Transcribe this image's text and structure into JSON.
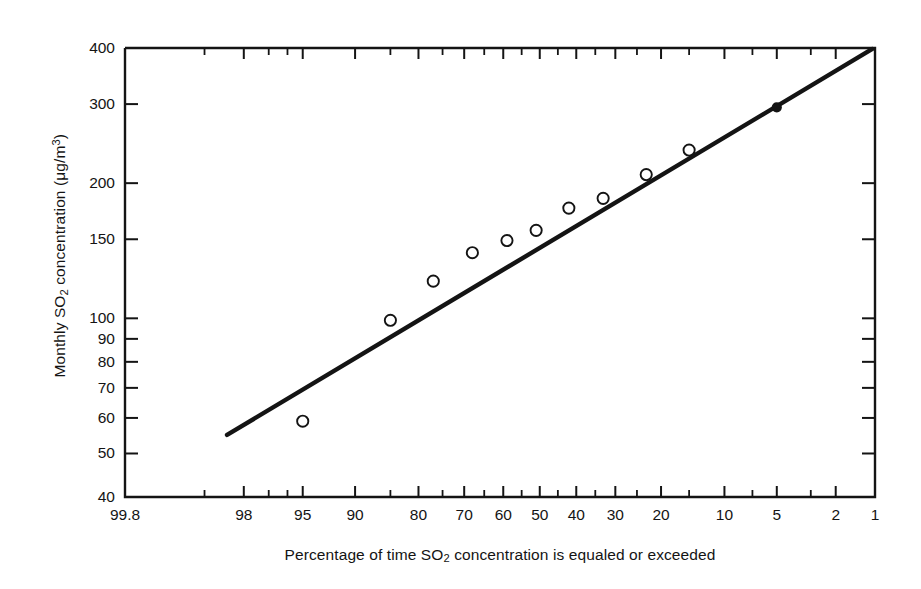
{
  "chart_data": {
    "type": "scatter",
    "title": "",
    "subtitle": "",
    "xlabel_parts": {
      "pre": "Percentage of time SO",
      "sub": "2",
      "post": " concentration is equaled or exceeded"
    },
    "ylabel_parts": {
      "pre": "Monthly SO",
      "sub": "2",
      "mid": " concentration (μg/m",
      "sup": "3",
      "post": ")"
    },
    "xlabel": "Percentage of time SO2 concentration is equaled or exceeded",
    "ylabel": "Monthly SO2 concentration (μg/m3)",
    "x_scale": "probability",
    "y_scale": "log",
    "xlim": [
      99.8,
      1
    ],
    "ylim": [
      40,
      400
    ],
    "grid": false,
    "legend": "none",
    "x_ticks": [
      {
        "value": 99.8,
        "label": "99.8"
      },
      {
        "value": 98,
        "label": "98"
      },
      {
        "value": 95,
        "label": "95"
      },
      {
        "value": 90,
        "label": "90"
      },
      {
        "value": 80,
        "label": "80"
      },
      {
        "value": 70,
        "label": "70"
      },
      {
        "value": 60,
        "label": "60"
      },
      {
        "value": 50,
        "label": "50"
      },
      {
        "value": 40,
        "label": "40"
      },
      {
        "value": 30,
        "label": "30"
      },
      {
        "value": 20,
        "label": "20"
      },
      {
        "value": 10,
        "label": "10"
      },
      {
        "value": 5,
        "label": "5"
      },
      {
        "value": 2,
        "label": "2"
      },
      {
        "value": 1,
        "label": "1"
      }
    ],
    "x_minor_ticks": [
      99,
      97,
      96,
      85,
      75,
      65,
      55,
      45,
      35,
      25,
      15,
      7,
      3
    ],
    "y_ticks": [
      {
        "value": 400,
        "label": "400"
      },
      {
        "value": 300,
        "label": "300"
      },
      {
        "value": 200,
        "label": "200"
      },
      {
        "value": 150,
        "label": "150"
      },
      {
        "value": 100,
        "label": "100"
      },
      {
        "value": 90,
        "label": "90"
      },
      {
        "value": 80,
        "label": "80"
      },
      {
        "value": 70,
        "label": "70"
      },
      {
        "value": 60,
        "label": "60"
      },
      {
        "value": 50,
        "label": "50"
      },
      {
        "value": 40,
        "label": "40"
      }
    ],
    "series": [
      {
        "name": "Observed monthly concentrations",
        "marker": "open-circle",
        "points": [
          {
            "x": 95,
            "y": 59
          },
          {
            "x": 85,
            "y": 99
          },
          {
            "x": 77,
            "y": 121
          },
          {
            "x": 68,
            "y": 140
          },
          {
            "x": 59,
            "y": 149
          },
          {
            "x": 51,
            "y": 157
          },
          {
            "x": 42,
            "y": 176
          },
          {
            "x": 33,
            "y": 185
          },
          {
            "x": 23,
            "y": 209
          },
          {
            "x": 15,
            "y": 237
          }
        ]
      },
      {
        "name": "Highlighted point",
        "marker": "filled-circle",
        "points": [
          {
            "x": 5,
            "y": 295
          }
        ]
      }
    ],
    "fit_line": {
      "name": "Log-normal fit line",
      "style": "solid",
      "color": "#141414",
      "x_start": 98.5,
      "y_start": 55,
      "x_end": 1.05,
      "y_end": 398
    },
    "colors": {
      "axis": "#141414",
      "marker_edge": "#141414",
      "marker_fill": "#ffffff",
      "filled_marker": "#141414",
      "background": "#ffffff"
    }
  }
}
